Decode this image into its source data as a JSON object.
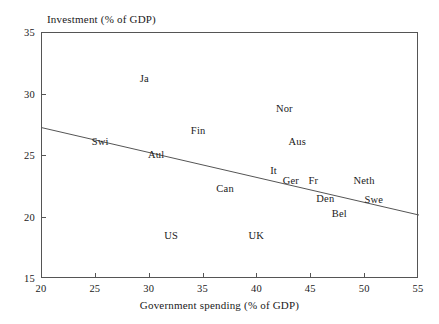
{
  "chart_data": {
    "type": "scatter",
    "title": "",
    "xlabel": "Government spending (% of GDP)",
    "ylabel": "Investment (% of GDP)",
    "xlim": [
      20,
      55
    ],
    "ylim": [
      15,
      35
    ],
    "xticks": [
      20,
      25,
      30,
      35,
      40,
      45,
      50,
      55
    ],
    "yticks": [
      15,
      20,
      25,
      30,
      35
    ],
    "grid": false,
    "legend": "none",
    "marker": "text-label-only",
    "points": [
      {
        "label": "Ja",
        "x": 29.5,
        "y": 31.3
      },
      {
        "label": "Swi",
        "x": 25.4,
        "y": 26.1
      },
      {
        "label": "Aul",
        "x": 30.6,
        "y": 25.1
      },
      {
        "label": "Fin",
        "x": 34.5,
        "y": 27.0
      },
      {
        "label": "Nor",
        "x": 42.5,
        "y": 28.8
      },
      {
        "label": "Aus",
        "x": 43.7,
        "y": 26.1
      },
      {
        "label": "It",
        "x": 41.5,
        "y": 23.8
      },
      {
        "label": "Ger",
        "x": 43.1,
        "y": 23.0
      },
      {
        "label": "Fr",
        "x": 45.2,
        "y": 23.0
      },
      {
        "label": "Neth",
        "x": 49.9,
        "y": 23.0
      },
      {
        "label": "Swe",
        "x": 50.8,
        "y": 21.4
      },
      {
        "label": "Can",
        "x": 37.0,
        "y": 22.3
      },
      {
        "label": "Den",
        "x": 46.3,
        "y": 21.5
      },
      {
        "label": "Bel",
        "x": 47.6,
        "y": 20.3
      },
      {
        "label": "US",
        "x": 32.0,
        "y": 18.5
      },
      {
        "label": "UK",
        "x": 39.9,
        "y": 18.5
      }
    ],
    "trend_line": {
      "name": "regression-line",
      "x0": 20,
      "y0": 27.3,
      "x1": 55,
      "y1": 20.2,
      "color": "#555555"
    },
    "axis_color": "#555555"
  }
}
